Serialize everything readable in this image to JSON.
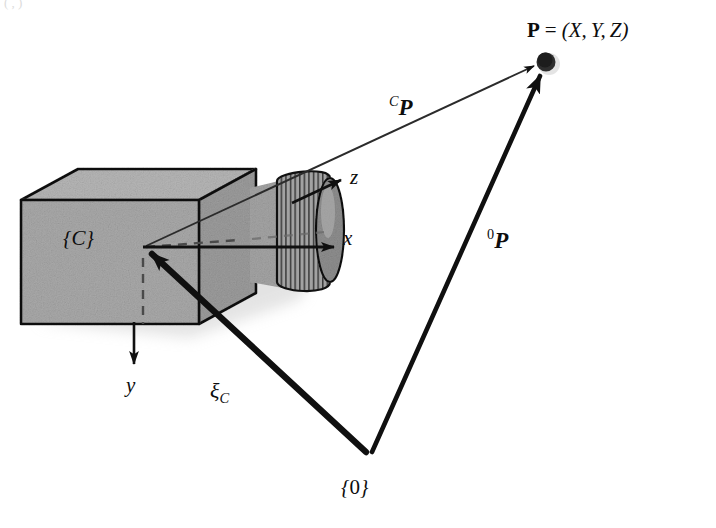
{
  "figure": {
    "background_color": "#ffffff",
    "ink_color": "#0d0d0d",
    "box_face_color": "#a9a9a9",
    "box_top_color": "#b4b4b4",
    "box_side_color": "#9e9e9e",
    "lens_color": "#9a9a9a",
    "shadow_color": "#cfcfcf"
  },
  "labels": {
    "point_coords": {
      "symbol": "P",
      "equals": "=",
      "open": "(",
      "x": "X",
      "comma1": ",",
      "y": "Y",
      "comma2": ",",
      "z": "Z",
      "close": ")"
    },
    "camera_vector": {
      "frame": "C",
      "symbol": "P"
    },
    "world_vector": {
      "frame": "0",
      "symbol": "P"
    },
    "axis_z": "z",
    "axis_x": "x",
    "axis_y": "y",
    "pose": {
      "symbol": "ξ",
      "frame": "C"
    },
    "camera_frame": {
      "open": "{",
      "name": "C",
      "close": "}"
    },
    "world_frame": {
      "open": "{",
      "name": "0",
      "close": "}"
    },
    "corner_artifact": "( , )"
  },
  "geometry": {
    "camera_origin": {
      "x": 143,
      "y": 247
    },
    "world_origin": {
      "x": 370,
      "y": 456
    },
    "point_P": {
      "x": 545,
      "y": 62
    },
    "axis_x_end": {
      "x": 338,
      "y": 247
    },
    "axis_y_end": {
      "x": 135,
      "y": 368
    },
    "axis_z_end": {
      "x": 345,
      "y": 178
    }
  }
}
